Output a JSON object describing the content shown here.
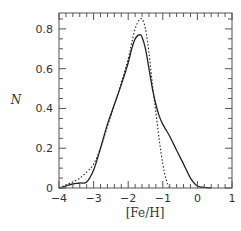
{
  "chart_data": {
    "type": "line",
    "title": "",
    "xlabel": "[Fe/H]",
    "ylabel": "N",
    "xlim": [
      -4,
      1
    ],
    "ylim": [
      0,
      0.88
    ],
    "grid": false,
    "legend": null,
    "x_ticks": [
      -4,
      -3,
      -2,
      -1,
      0,
      1
    ],
    "x_tick_labels": [
      "−4",
      "−3",
      "−2",
      "−1",
      "0",
      "1"
    ],
    "y_ticks": [
      0,
      0.2,
      0.4,
      0.6,
      0.8
    ],
    "y_tick_labels": [
      "0",
      "0.2",
      "0.4",
      "0.6",
      "0.8"
    ],
    "series": [
      {
        "name": "solid",
        "style": "solid",
        "color": "#222222",
        "x": [
          -4.0,
          -3.8,
          -3.6,
          -3.4,
          -3.2,
          -3.0,
          -2.8,
          -2.6,
          -2.4,
          -2.2,
          -2.0,
          -1.9,
          -1.8,
          -1.7,
          -1.65,
          -1.6,
          -1.5,
          -1.4,
          -1.3,
          -1.2,
          -1.1,
          -1.0,
          -0.9,
          -0.8,
          -0.6,
          -0.4,
          -0.2,
          0.0,
          0.2,
          0.4
        ],
        "y": [
          0.0,
          0.01,
          0.02,
          0.025,
          0.03,
          0.09,
          0.2,
          0.32,
          0.42,
          0.52,
          0.63,
          0.7,
          0.75,
          0.77,
          0.77,
          0.76,
          0.7,
          0.6,
          0.5,
          0.42,
          0.36,
          0.32,
          0.29,
          0.26,
          0.19,
          0.12,
          0.05,
          0.01,
          0.003,
          0.0
        ]
      },
      {
        "name": "dotted",
        "style": "dotted",
        "color": "#222222",
        "x": [
          -4.0,
          -3.8,
          -3.6,
          -3.4,
          -3.2,
          -3.0,
          -2.8,
          -2.6,
          -2.4,
          -2.2,
          -2.0,
          -1.9,
          -1.8,
          -1.7,
          -1.6,
          -1.5,
          -1.4,
          -1.3,
          -1.2,
          -1.1,
          -1.0,
          -0.9,
          -0.8
        ],
        "y": [
          0.0,
          0.015,
          0.03,
          0.05,
          0.08,
          0.12,
          0.2,
          0.31,
          0.42,
          0.53,
          0.65,
          0.73,
          0.8,
          0.84,
          0.85,
          0.8,
          0.68,
          0.52,
          0.38,
          0.24,
          0.12,
          0.04,
          0.0
        ]
      }
    ]
  }
}
